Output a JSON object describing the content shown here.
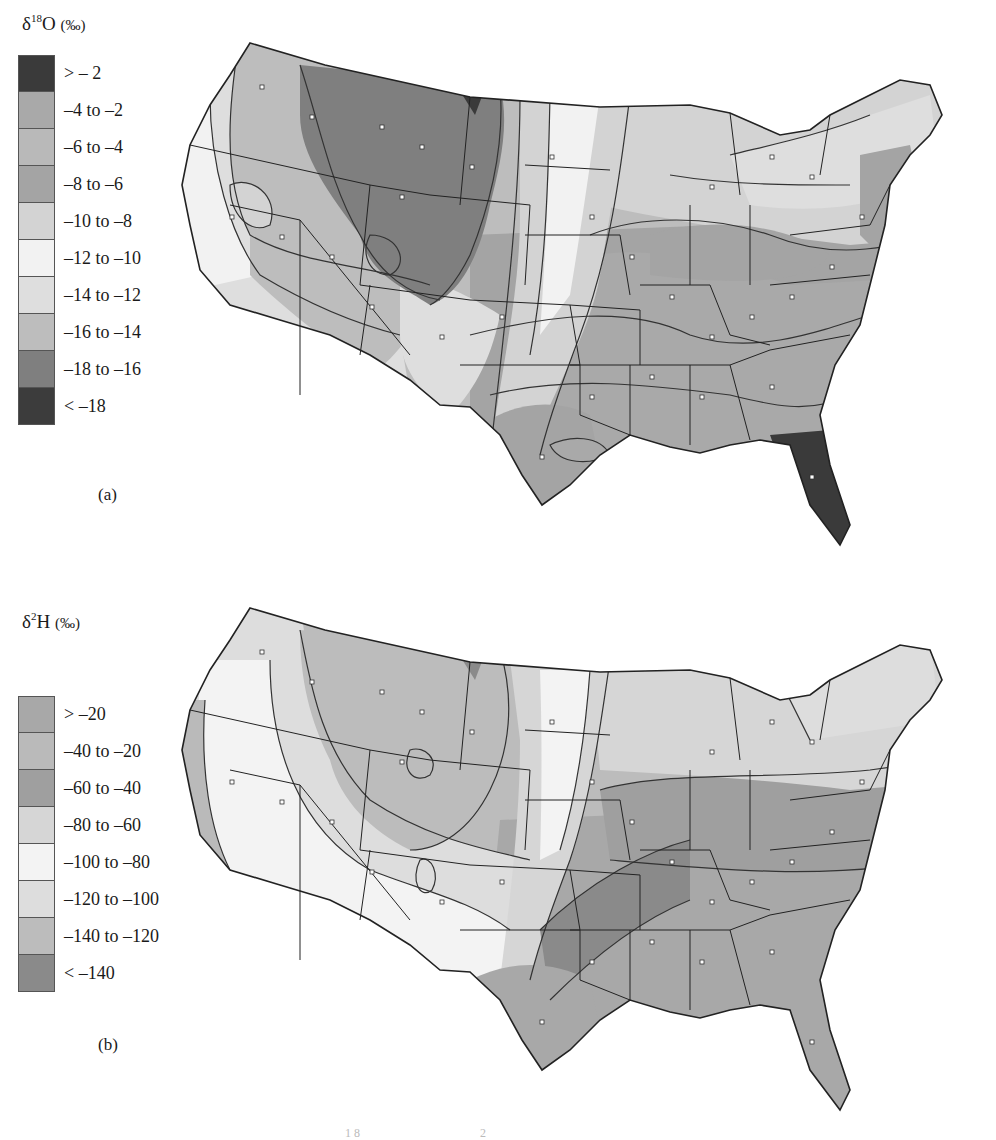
{
  "figure": {
    "panels": [
      {
        "id": "a",
        "label": "(a)",
        "legend_title": {
          "delta": "δ",
          "isotope_sup": "18",
          "element": "O",
          "unit": "(‰)"
        },
        "legend": [
          {
            "label": "> – 2",
            "shade": "#3a3a3a"
          },
          {
            "label": "–4 to –2",
            "shade": "#a9a9a9"
          },
          {
            "label": "–6 to –4",
            "shade": "#b9b9b9"
          },
          {
            "label": "–8 to –6",
            "shade": "#a4a4a4"
          },
          {
            "label": "–10 to –8",
            "shade": "#d3d3d3"
          },
          {
            "label": "–12 to –10",
            "shade": "#f2f2f2"
          },
          {
            "label": "–14 to –12",
            "shade": "#dedede"
          },
          {
            "label": "–16 to –14",
            "shade": "#bdbdbd"
          },
          {
            "label": "–18 to –16",
            "shade": "#7f7f7f"
          },
          {
            "label": "< –18",
            "shade": "#3c3c3c"
          }
        ]
      },
      {
        "id": "b",
        "label": "(b)",
        "legend_title": {
          "delta": "δ",
          "isotope_sup": "2",
          "element": "H",
          "unit": "(‰)"
        },
        "legend": [
          {
            "label": "> –20",
            "shade": "#a8a8a8"
          },
          {
            "label": "–40 to –20",
            "shade": "#bababa"
          },
          {
            "label": "–60 to –40",
            "shade": "#9f9f9f"
          },
          {
            "label": "–80 to –60",
            "shade": "#d6d6d6"
          },
          {
            "label": "–100 to –80",
            "shade": "#f3f3f3"
          },
          {
            "label": "–120 to –100",
            "shade": "#dddddd"
          },
          {
            "label": "–140 to –120",
            "shade": "#bcbcbc"
          },
          {
            "label": "< –140",
            "shade": "#8a8a8a"
          }
        ]
      }
    ],
    "caption_fragment": {
      "sup1": "18",
      "sup2": "2"
    }
  }
}
